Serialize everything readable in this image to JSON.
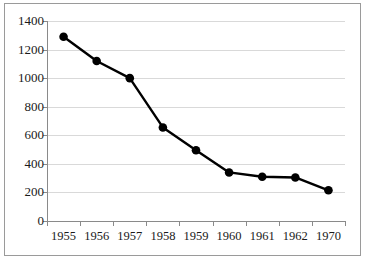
{
  "chart_data": {
    "type": "line",
    "title": "",
    "subtitle": "",
    "xlabel": "",
    "ylabel": "",
    "categories": [
      "1955",
      "1956",
      "1957",
      "1958",
      "1959",
      "1960",
      "1961",
      "1962",
      "1970"
    ],
    "values": [
      1290,
      1120,
      1000,
      655,
      495,
      340,
      310,
      305,
      215
    ],
    "series": [
      {
        "name": "",
        "values": [
          1290,
          1120,
          1000,
          655,
          495,
          340,
          310,
          305,
          215
        ]
      }
    ],
    "ylim": [
      0,
      1400
    ],
    "y_ticks": [
      0,
      200,
      400,
      600,
      800,
      1000,
      1200,
      1400
    ],
    "y_tick_labels": [
      "0",
      "200",
      "400",
      "600",
      "800",
      "1000",
      "1200",
      "1400"
    ],
    "x_tick_labels": [
      "1955",
      "1956",
      "1957",
      "1958",
      "1959",
      "1960",
      "1961",
      "1962",
      "1970"
    ],
    "grid": "horizontal",
    "legend": "none",
    "marker": "filled-circle",
    "line_color": "#000000",
    "marker_color": "#000000",
    "grid_color": "#d9d9d9",
    "axis_color": "#8a8a8a",
    "background_color": "#ffffff",
    "annotations": []
  },
  "figure": {
    "border_color": "#9a9a9a"
  }
}
